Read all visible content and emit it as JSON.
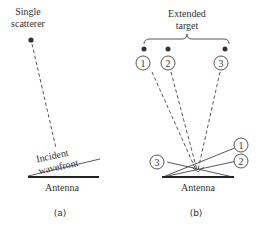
{
  "panel_a": {
    "scatterer_label_line1": "Single",
    "scatterer_label_line2": "scatterer",
    "wavefront_label_line1": "Incident",
    "wavefront_label_line2": "wavefront",
    "antenna_label": "Antenna",
    "caption": "(a)"
  },
  "panel_b": {
    "target_label_line1": "Extended",
    "target_label_line2": "target",
    "scatterers": [
      {
        "label": "1"
      },
      {
        "label": "2"
      },
      {
        "label": "3"
      }
    ],
    "wavefronts": [
      {
        "label": "1"
      },
      {
        "label": "2"
      },
      {
        "label": "3"
      }
    ],
    "antenna_label": "Antenna",
    "caption": "(b)"
  },
  "colors": {
    "ink": "#333333"
  }
}
